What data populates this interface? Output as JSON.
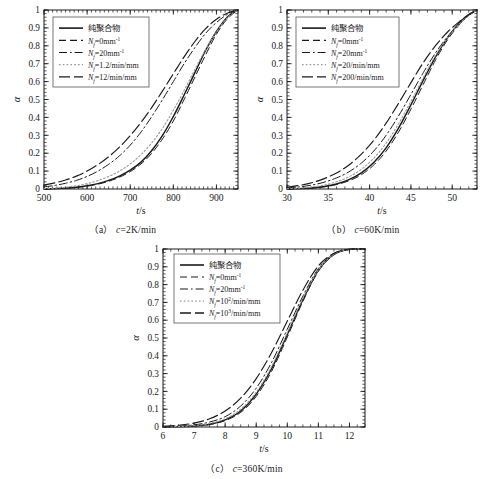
{
  "figure": {
    "panels": [
      {
        "id": "a",
        "caption_index": "（a）",
        "caption_text": "c=2K/min",
        "caption_var": "c",
        "caption_value": "=2K/min"
      },
      {
        "id": "b",
        "caption_index": "（b）",
        "caption_text": "c=60K/min",
        "caption_var": "c",
        "caption_value": "=60K/min"
      },
      {
        "id": "c",
        "caption_index": "（c）",
        "caption_text": "c=360K/min",
        "caption_var": "c",
        "caption_value": "=360K/min"
      }
    ]
  },
  "axis_common": {
    "ylabel": "α",
    "xlabel_num": "t",
    "xlabel_den": "/s",
    "xlabel": "t/s",
    "yticks": [
      "0",
      "0.1",
      "0.2",
      "0.3",
      "0.4",
      "0.5",
      "0.6",
      "0.7",
      "0.8",
      "0.9",
      "1"
    ],
    "ylim": [
      0,
      1
    ]
  },
  "legend_symbol": {
    "var": "N",
    "sub": "f"
  },
  "chart_data": [
    {
      "type": "line",
      "panel": "a",
      "title": "（a）c=2K/min",
      "xlabel": "t/s",
      "ylabel": "α",
      "xlim": [
        500,
        950
      ],
      "ylim": [
        0,
        1
      ],
      "xticks": [
        500,
        600,
        700,
        800,
        900
      ],
      "yticks": [
        0,
        0.1,
        0.2,
        0.3,
        0.4,
        0.5,
        0.6,
        0.7,
        0.8,
        0.9,
        1
      ],
      "grid": false,
      "legend_position": "upper-left",
      "x": [
        500,
        525,
        550,
        575,
        600,
        625,
        650,
        675,
        700,
        725,
        750,
        775,
        800,
        825,
        850,
        875,
        900,
        925,
        950
      ],
      "series": [
        {
          "name": "纯聚合物",
          "style": "solid",
          "color": "#1a1a1a",
          "values": [
            0.0,
            0.002,
            0.005,
            0.01,
            0.018,
            0.03,
            0.048,
            0.072,
            0.105,
            0.15,
            0.215,
            0.3,
            0.405,
            0.525,
            0.65,
            0.775,
            0.88,
            0.96,
            1.0
          ]
        },
        {
          "name": "N_f=0mm^-1",
          "label_value": "=0mm",
          "label_exp": "-1",
          "style": "dashed",
          "color": "#1a1a1a",
          "values": [
            0.0,
            0.002,
            0.005,
            0.009,
            0.016,
            0.027,
            0.043,
            0.066,
            0.097,
            0.14,
            0.2,
            0.28,
            0.38,
            0.5,
            0.625,
            0.75,
            0.865,
            0.95,
            1.0
          ]
        },
        {
          "name": "N_f=20mm^-1",
          "label_value": "=20mm",
          "label_exp": "-1",
          "style": "dashdot",
          "color": "#1a1a1a",
          "values": [
            0.012,
            0.02,
            0.032,
            0.048,
            0.07,
            0.1,
            0.138,
            0.185,
            0.245,
            0.318,
            0.405,
            0.5,
            0.6,
            0.7,
            0.79,
            0.87,
            0.93,
            0.975,
            1.0
          ]
        },
        {
          "name": "N_f=1.2/min/mm",
          "label_value": "=1.2/min/mm",
          "label_exp": "",
          "style": "dotted",
          "color": "#9a9a9a",
          "values": [
            0.002,
            0.005,
            0.01,
            0.018,
            0.03,
            0.047,
            0.07,
            0.1,
            0.14,
            0.192,
            0.258,
            0.34,
            0.44,
            0.55,
            0.668,
            0.78,
            0.878,
            0.955,
            1.0
          ]
        },
        {
          "name": "N_f=12/min/mm",
          "label_value": "=12/min/mm",
          "label_exp": "",
          "style": "longdash",
          "color": "#1a1a1a",
          "values": [
            0.022,
            0.034,
            0.05,
            0.072,
            0.1,
            0.136,
            0.18,
            0.234,
            0.298,
            0.372,
            0.456,
            0.548,
            0.644,
            0.738,
            0.824,
            0.896,
            0.948,
            0.982,
            1.0
          ]
        }
      ]
    },
    {
      "type": "line",
      "panel": "b",
      "title": "（b）c=60K/min",
      "xlabel": "t/s",
      "ylabel": "α",
      "xlim": [
        30,
        53
      ],
      "ylim": [
        0,
        1
      ],
      "xticks": [
        30,
        35,
        40,
        45,
        50
      ],
      "yticks": [
        0,
        0.1,
        0.2,
        0.3,
        0.4,
        0.5,
        0.6,
        0.7,
        0.8,
        0.9,
        1
      ],
      "grid": false,
      "legend_position": "upper-left",
      "x": [
        30,
        31.5,
        33,
        34.5,
        36,
        37.5,
        39,
        40.5,
        42,
        43.5,
        45,
        46.5,
        48,
        49.5,
        51,
        52,
        53
      ],
      "series": [
        {
          "name": "纯聚合物",
          "style": "solid",
          "color": "#1a1a1a",
          "values": [
            0.0,
            0.002,
            0.006,
            0.014,
            0.028,
            0.052,
            0.09,
            0.148,
            0.23,
            0.34,
            0.47,
            0.608,
            0.74,
            0.85,
            0.935,
            0.975,
            1.0
          ]
        },
        {
          "name": "N_f=0mm^-1",
          "label_value": "=0mm",
          "label_exp": "-1",
          "style": "dashed",
          "color": "#1a1a1a",
          "values": [
            0.0,
            0.002,
            0.005,
            0.012,
            0.025,
            0.046,
            0.08,
            0.134,
            0.212,
            0.318,
            0.446,
            0.585,
            0.722,
            0.838,
            0.925,
            0.97,
            1.0
          ]
        },
        {
          "name": "N_f=20mm^-1",
          "label_value": "=20mm",
          "label_exp": "-1",
          "style": "dashdot",
          "color": "#1a1a1a",
          "values": [
            0.006,
            0.012,
            0.022,
            0.038,
            0.062,
            0.096,
            0.145,
            0.212,
            0.3,
            0.408,
            0.528,
            0.65,
            0.762,
            0.855,
            0.928,
            0.968,
            1.0
          ]
        },
        {
          "name": "N_f=20/min/mm",
          "label_value": "=20/min/mm",
          "label_exp": "",
          "style": "dotted",
          "color": "#9a9a9a",
          "values": [
            0.002,
            0.005,
            0.011,
            0.022,
            0.04,
            0.068,
            0.11,
            0.172,
            0.256,
            0.364,
            0.49,
            0.622,
            0.748,
            0.85,
            0.928,
            0.97,
            1.0
          ]
        },
        {
          "name": "N_f=200/min/mm",
          "label_value": "=200/min/mm",
          "label_exp": "",
          "style": "longdash",
          "color": "#1a1a1a",
          "values": [
            0.01,
            0.02,
            0.035,
            0.058,
            0.09,
            0.134,
            0.195,
            0.272,
            0.368,
            0.478,
            0.594,
            0.706,
            0.802,
            0.88,
            0.94,
            0.974,
            1.0
          ]
        }
      ]
    },
    {
      "type": "line",
      "panel": "c",
      "title": "（c）c=360K/min",
      "xlabel": "t/s",
      "ylabel": "α",
      "xlim": [
        6,
        12.5
      ],
      "ylim": [
        0,
        1
      ],
      "xticks": [
        6,
        7,
        8,
        9,
        10,
        11,
        12
      ],
      "yticks": [
        0,
        0.1,
        0.2,
        0.3,
        0.4,
        0.5,
        0.6,
        0.7,
        0.8,
        0.9,
        1
      ],
      "grid": false,
      "legend_position": "upper-left",
      "x": [
        6,
        6.5,
        7,
        7.5,
        8,
        8.5,
        9,
        9.5,
        10,
        10.5,
        11,
        11.5,
        12,
        12.5
      ],
      "series": [
        {
          "name": "纯聚合物",
          "style": "solid",
          "color": "#1a1a1a",
          "values": [
            0.0,
            0.002,
            0.006,
            0.015,
            0.04,
            0.09,
            0.185,
            0.33,
            0.52,
            0.715,
            0.88,
            0.97,
            0.998,
            1.0
          ]
        },
        {
          "name": "N_f=0mm^-1",
          "label_value": "=0mm",
          "label_exp": "-1",
          "style": "dashed",
          "color": "#1a1a1a",
          "values": [
            0.0,
            0.002,
            0.006,
            0.014,
            0.036,
            0.082,
            0.172,
            0.315,
            0.505,
            0.705,
            0.875,
            0.968,
            0.997,
            1.0
          ]
        },
        {
          "name": "N_f=20mm^-1",
          "label_value": "=20mm",
          "label_exp": "-1",
          "style": "dashdot",
          "color": "#1a1a1a",
          "values": [
            0.002,
            0.005,
            0.012,
            0.028,
            0.058,
            0.118,
            0.218,
            0.365,
            0.55,
            0.735,
            0.89,
            0.972,
            0.998,
            1.0
          ]
        },
        {
          "name": "N_f=10^2/min/mm",
          "label_value": "=10",
          "label_exp": "2",
          "label_suffix": "/min/mm",
          "style": "dotted",
          "color": "#9a9a9a",
          "values": [
            0.001,
            0.003,
            0.008,
            0.02,
            0.046,
            0.1,
            0.196,
            0.342,
            0.53,
            0.722,
            0.882,
            0.97,
            0.998,
            1.0
          ]
        },
        {
          "name": "N_f=10^3/min/mm",
          "label_value": "=10",
          "label_exp": "3",
          "label_suffix": "/min/mm",
          "style": "longdash",
          "color": "#1a1a1a",
          "values": [
            0.004,
            0.01,
            0.022,
            0.046,
            0.09,
            0.162,
            0.272,
            0.42,
            0.595,
            0.768,
            0.905,
            0.976,
            0.999,
            1.0
          ]
        }
      ]
    }
  ]
}
